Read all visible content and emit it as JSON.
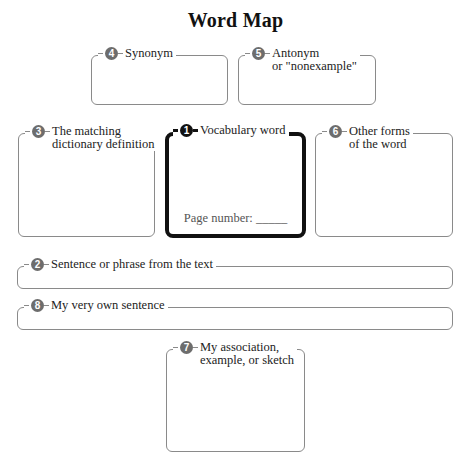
{
  "title": "Word Map",
  "boxes": {
    "synonym": {
      "number": "4",
      "lines": [
        "Synonym"
      ]
    },
    "antonym": {
      "number": "5",
      "lines": [
        "Antonym",
        "or \"nonexample\""
      ]
    },
    "definition": {
      "number": "3",
      "lines": [
        "The matching",
        "dictionary definition"
      ]
    },
    "vocabulary": {
      "number": "1",
      "lines": [
        "Vocabulary word"
      ],
      "page_number_label": "Page number: _____"
    },
    "other_forms": {
      "number": "6",
      "lines": [
        "Other forms",
        "of the word"
      ]
    },
    "sentence_text": {
      "number": "2",
      "lines": [
        "Sentence or phrase from the text"
      ]
    },
    "own_sentence": {
      "number": "8",
      "lines": [
        "My very own sentence"
      ]
    },
    "association": {
      "number": "7",
      "lines": [
        "My association,",
        "example, or sketch"
      ]
    }
  }
}
